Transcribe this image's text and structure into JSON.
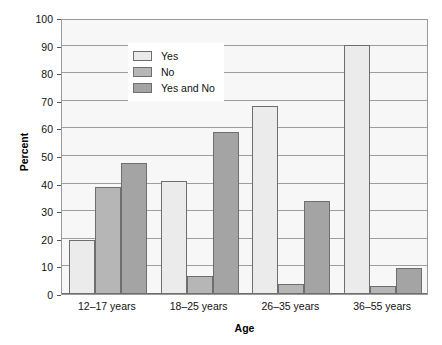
{
  "chart_data": {
    "type": "bar",
    "title": "",
    "xlabel": "Age",
    "ylabel": "Percent",
    "ylim": [
      0,
      100
    ],
    "ytick_step": 10,
    "yticks": [
      0,
      10,
      20,
      30,
      40,
      50,
      60,
      70,
      80,
      90,
      100
    ],
    "grid": true,
    "legend_position": "inside top-left",
    "categories": [
      "12–17 years",
      "18–25 years",
      "26–35 years",
      "36–55 years"
    ],
    "series": [
      {
        "name": "Yes",
        "color": "#ebebeb",
        "values": [
          19.5,
          41.0,
          68.3,
          90.3
        ]
      },
      {
        "name": "No",
        "color": "#b6b6b6",
        "values": [
          38.8,
          6.7,
          3.8,
          2.9
        ]
      },
      {
        "name": "Yes and No",
        "color": "#a4a4a4",
        "values": [
          47.5,
          58.7,
          33.7,
          9.5
        ]
      }
    ]
  },
  "axes": {
    "y_title": "Percent",
    "x_title": "Age"
  },
  "legend": {
    "items": [
      {
        "label": "Yes"
      },
      {
        "label": "No"
      },
      {
        "label": "Yes and No"
      }
    ]
  },
  "colors": {
    "plot_background": "#f7f7f7",
    "gridline": "#9d9d9d",
    "axis_line": "#6b6b6b",
    "bar_border": "#6e6e6e",
    "page_background": "#ffffff"
  }
}
